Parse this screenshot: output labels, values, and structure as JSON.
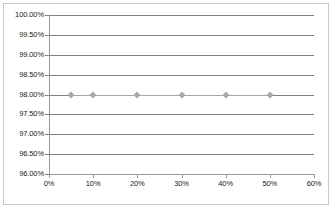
{
  "chart_data": {
    "type": "line",
    "title": "",
    "subtitle": "",
    "xlabel": "",
    "ylabel": "",
    "xlim": [
      0,
      60
    ],
    "ylim": [
      96.0,
      100.0
    ],
    "grid": true,
    "legend": "none",
    "x_tick_labels": [
      "0%",
      "10%",
      "20%",
      "30%",
      "40%",
      "50%",
      "60%"
    ],
    "x_ticks": [
      0,
      10,
      20,
      30,
      40,
      50,
      60
    ],
    "y_tick_labels": [
      "100.00%",
      "99.50%",
      "99.00%",
      "98.50%",
      "98.00%",
      "97.50%",
      "97.00%",
      "96.50%",
      "96.00%"
    ],
    "y_ticks": [
      100.0,
      99.5,
      99.0,
      98.5,
      98.0,
      97.5,
      97.0,
      96.5,
      96.0
    ],
    "series": [
      {
        "name": "",
        "marker": "diamond",
        "color": "#a8a8a8",
        "x": [
          5,
          10,
          20,
          30,
          40,
          50
        ],
        "x_labels": [
          "5%",
          "10%",
          "20%",
          "30%",
          "40%",
          "50%"
        ],
        "values": [
          98.0,
          98.0,
          98.0,
          98.0,
          98.0,
          98.0
        ],
        "value_labels": [
          "98.00%",
          "98.00%",
          "98.00%",
          "98.00%",
          "98.00%",
          "98.00%"
        ]
      }
    ]
  },
  "colors": {
    "gridline": "#7f7f7f",
    "axis": "#9a9a9a",
    "border": "#c9c9c9",
    "series": "#a8a8a8",
    "text": "#1a1a1a",
    "background": "#ffffff"
  }
}
